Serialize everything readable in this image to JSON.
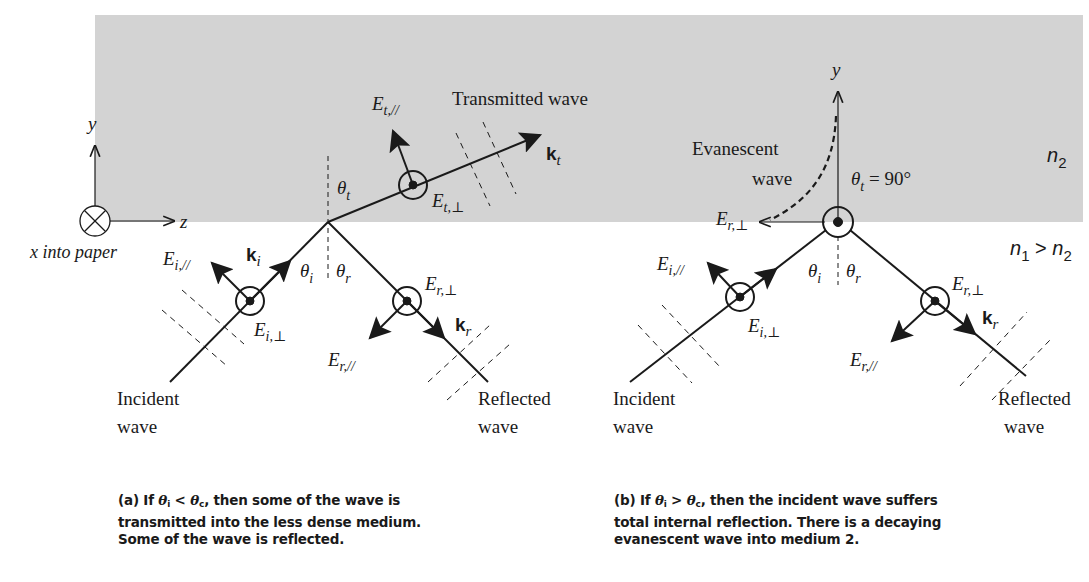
{
  "figure": {
    "background_medium2_color": "#d3d3d3",
    "line_color": "#1a1a1a"
  },
  "panel_a": {
    "axes": {
      "y_label": "y",
      "z_label": "z",
      "x_note": "x into paper"
    },
    "labels": {
      "E_t_par": {
        "base": "E",
        "sub": "t,//"
      },
      "transmitted": "Transmitted wave",
      "k_t": {
        "base": "k",
        "sub": "t"
      },
      "theta_t": {
        "base": "θ",
        "sub": "t"
      },
      "E_t_perp": {
        "base": "E",
        "sub": "t,⊥"
      },
      "E_i_par": {
        "base": "E",
        "sub": "i,//"
      },
      "k_i": {
        "base": "k",
        "sub": "i"
      },
      "theta_i": {
        "base": "θ",
        "sub": "i"
      },
      "theta_r": {
        "base": "θ",
        "sub": "r"
      },
      "E_r_perp": {
        "base": "E",
        "sub": "r,⊥"
      },
      "E_i_perp": {
        "base": "E",
        "sub": "i,⊥"
      },
      "E_r_par": {
        "base": "E",
        "sub": "r,//"
      },
      "k_r": {
        "base": "k",
        "sub": "r"
      },
      "incident_1": "Incident",
      "incident_2": "wave",
      "reflected_1": "Reflected",
      "reflected_2": "wave"
    },
    "caption": {
      "prefix": "(a) If ",
      "cond_lhs": "θ",
      "cond_lhs_sub": "i",
      "op": " < ",
      "cond_rhs": "θ",
      "cond_rhs_sub": "c",
      "line1_rest": ", then some of the wave is",
      "line2": "transmitted into the less dense medium.",
      "line3": "Some of the wave is reflected."
    }
  },
  "panel_b": {
    "labels": {
      "y_axis": "y",
      "evanescent_1": "Evanescent",
      "evanescent_2": "wave",
      "theta_t": {
        "base": "θ",
        "sub": "t",
        "value": " = 90°"
      },
      "n2": {
        "base": "n",
        "sub": "2"
      },
      "n1_gt_n2": {
        "base1": "n",
        "sub1": "1",
        "op": " > ",
        "base2": "n",
        "sub2": "2"
      },
      "E_r_perp_top": {
        "base": "E",
        "sub": "r,⊥"
      },
      "E_i_par": {
        "base": "E",
        "sub": "i,//"
      },
      "theta_i": {
        "base": "θ",
        "sub": "i"
      },
      "theta_r": {
        "base": "θ",
        "sub": "r"
      },
      "E_r_perp": {
        "base": "E",
        "sub": "r,⊥"
      },
      "E_i_perp": {
        "base": "E",
        "sub": "i,⊥"
      },
      "k_r": {
        "base": "k",
        "sub": "r"
      },
      "E_r_par": {
        "base": "E",
        "sub": "r,//"
      },
      "incident_1": "Incident",
      "incident_2": "wave",
      "reflected_1": "Reflected",
      "reflected_2": "wave"
    },
    "caption": {
      "prefix": "(b) If ",
      "cond_lhs": "θ",
      "cond_lhs_sub": "i",
      "op": " > ",
      "cond_rhs": "θ",
      "cond_rhs_sub": "c",
      "line1_rest": ", then the incident wave suffers",
      "line2": "total internal reflection. There is a decaying",
      "line3": "evanescent wave into medium 2."
    }
  }
}
